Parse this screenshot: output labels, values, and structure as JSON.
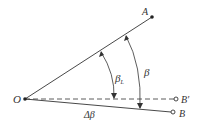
{
  "diagram": {
    "points": {
      "O": {
        "label": "O",
        "x": 25,
        "y": 99
      },
      "A": {
        "label": "A",
        "x": 152,
        "y": 17
      },
      "B_prime": {
        "label": "B′",
        "x": 176,
        "y": 99
      },
      "B": {
        "label": "B",
        "x": 173,
        "y": 112
      }
    },
    "angles": {
      "beta_L": {
        "symbol": "β",
        "subscript": "L"
      },
      "beta": {
        "symbol": "β"
      },
      "delta_beta": {
        "symbol": "Δβ"
      }
    },
    "colors": {
      "line": "#333333",
      "background": "#ffffff"
    }
  }
}
